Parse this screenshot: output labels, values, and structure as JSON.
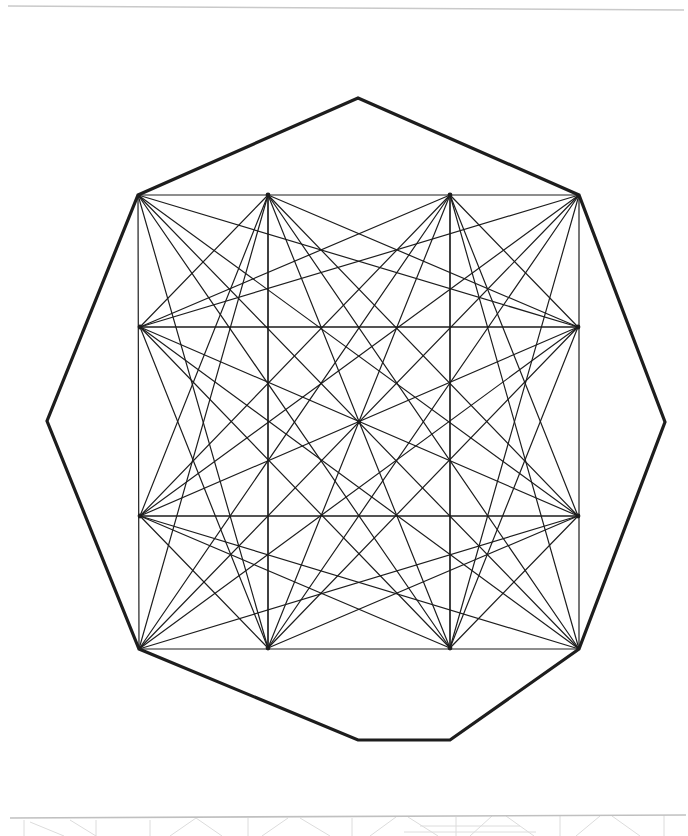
{
  "document": {
    "kind": "geometric-line-figure",
    "title": "Nonagon circumscribing a square with inscribed octagon and full diagonal net",
    "background_color": "#ffffff",
    "ink_color": "#1d1d1d",
    "faint_ink_color": "#c9c9c9",
    "canvas": {
      "width": 688,
      "height": 836
    }
  },
  "chart_data": {
    "type": "diagram",
    "xlabel": "",
    "ylabel": "",
    "xlim": [
      0,
      688
    ],
    "ylim": [
      0,
      836
    ],
    "grid": false,
    "legend": null,
    "layers": [
      {
        "name": "outer-nonagon",
        "shape": "polygon",
        "closed": true,
        "stroke": "#1d1d1d",
        "stroke_width": 3.2,
        "fill": "none",
        "vertex_count": 9,
        "points": [
          [
            358,
            98
          ],
          [
            579,
            195
          ],
          [
            665,
            422
          ],
          [
            579,
            649
          ],
          [
            450,
            740
          ],
          [
            358,
            740
          ],
          [
            139,
            649
          ],
          [
            47,
            421
          ],
          [
            138,
            195
          ]
        ]
      },
      {
        "name": "inner-square",
        "shape": "polygon",
        "closed": true,
        "stroke": "#1d1d1d",
        "stroke_width": 1.2,
        "fill": "none",
        "vertex_count": 4,
        "points": [
          [
            138,
            195
          ],
          [
            579,
            195
          ],
          [
            579,
            649
          ],
          [
            139,
            649
          ]
        ]
      },
      {
        "name": "inscribed-octagon-complete-graph",
        "shape": "complete-graph",
        "stroke": "#1d1d1d",
        "stroke_width": 1.2,
        "fill": "none",
        "node_count": 8,
        "edge_count": 28,
        "nodes": [
          {
            "id": "N0",
            "label": "top-left-corner",
            "x": 138,
            "y": 195
          },
          {
            "id": "N1",
            "label": "top-left-mid",
            "x": 268,
            "y": 195
          },
          {
            "id": "N2",
            "label": "top-right-mid",
            "x": 450,
            "y": 195
          },
          {
            "id": "N3",
            "label": "top-right-corner",
            "x": 579,
            "y": 195
          },
          {
            "id": "N4",
            "label": "right-upper-mid",
            "x": 578,
            "y": 327
          },
          {
            "id": "N5",
            "label": "right-lower-mid",
            "x": 578,
            "y": 516
          },
          {
            "id": "N6",
            "label": "bottom-right-corner",
            "x": 579,
            "y": 649
          },
          {
            "id": "N7",
            "label": "bottom-right-mid",
            "x": 450,
            "y": 648
          },
          {
            "id": "N8",
            "label": "bottom-left-mid",
            "x": 268,
            "y": 648
          },
          {
            "id": "N9",
            "label": "bottom-left-corner",
            "x": 139,
            "y": 649
          },
          {
            "id": "N10",
            "label": "left-lower-mid",
            "x": 140,
            "y": 516
          },
          {
            "id": "N11",
            "label": "left-upper-mid",
            "x": 140,
            "y": 327
          }
        ]
      },
      {
        "name": "octagon-hub-nodes",
        "shape": "points",
        "description": "Eight hub vertices of the inscribed octagon from which all diagonals radiate",
        "marker": "dot",
        "radius": 2.4,
        "fill": "#1d1d1d",
        "points": [
          [
            268,
            195
          ],
          [
            450,
            195
          ],
          [
            578,
            327
          ],
          [
            578,
            516
          ],
          [
            450,
            648
          ],
          [
            268,
            648
          ],
          [
            140,
            516
          ],
          [
            140,
            327
          ]
        ]
      },
      {
        "name": "center-node",
        "shape": "point",
        "marker": "dot",
        "radius": 2.2,
        "fill": "#1d1d1d",
        "points": [
          [
            359,
            422
          ]
        ]
      },
      {
        "name": "scan-artifact-top-rule",
        "shape": "line",
        "stroke": "#c9c9c9",
        "stroke_width": 1.4,
        "points": [
          [
            8,
            6
          ],
          [
            684,
            10
          ]
        ]
      },
      {
        "name": "scan-artifact-bottom-rule",
        "shape": "line",
        "stroke": "#c0c0c0",
        "stroke_width": 1.6,
        "points": [
          [
            10,
            818
          ],
          [
            686,
            815
          ]
        ]
      },
      {
        "name": "scan-artifact-bottom-bleed",
        "shape": "line-bundle",
        "description": "Faint bleed-through of the following plate's figure cropped at the page edge",
        "stroke": "#dcdcdc",
        "stroke_width": 1.0,
        "segments": [
          [
            [
              24,
              820
            ],
            [
              24,
              836
            ]
          ],
          [
            [
              70,
              820
            ],
            [
              96,
              836
            ]
          ],
          [
            [
              96,
              820
            ],
            [
              96,
              836
            ]
          ],
          [
            [
              150,
              820
            ],
            [
              150,
              836
            ]
          ],
          [
            [
              196,
              818
            ],
            [
              170,
              836
            ]
          ],
          [
            [
              196,
              818
            ],
            [
              222,
              836
            ]
          ],
          [
            [
              248,
              818
            ],
            [
              248,
              836
            ]
          ],
          [
            [
              288,
              818
            ],
            [
              262,
              836
            ]
          ],
          [
            [
              300,
              818
            ],
            [
              330,
              836
            ]
          ],
          [
            [
              352,
              818
            ],
            [
              352,
              836
            ]
          ],
          [
            [
              396,
              817
            ],
            [
              370,
              836
            ]
          ],
          [
            [
              408,
              817
            ],
            [
              438,
              836
            ]
          ],
          [
            [
              456,
              817
            ],
            [
              456,
              836
            ]
          ],
          [
            [
              492,
              816
            ],
            [
              470,
              836
            ]
          ],
          [
            [
              506,
              816
            ],
            [
              534,
              836
            ]
          ],
          [
            [
              560,
              816
            ],
            [
              560,
              836
            ]
          ],
          [
            [
              600,
              816
            ],
            [
              576,
              836
            ]
          ],
          [
            [
              612,
              816
            ],
            [
              640,
              836
            ]
          ],
          [
            [
              664,
              815
            ],
            [
              664,
              836
            ]
          ],
          [
            [
              420,
              826
            ],
            [
              520,
              826
            ]
          ],
          [
            [
              404,
              832
            ],
            [
              536,
              832
            ]
          ],
          [
            [
              30,
              822
            ],
            [
              64,
              836
            ]
          ]
        ]
      }
    ],
    "notes": [
      "The outer heavy outline is an irregular nine-sided polygon.",
      "Four of the nonagon's vertices coincide with the corners of the inner square.",
      "The octagon's eight vertices are the square's four corners plus four points on the square's edges.",
      "All 28 chords of the octagon (the complete graph K8) are drawn, producing the interior star net.",
      "Vertical and horizontal median lines of the square pass through the figure's center."
    ]
  }
}
